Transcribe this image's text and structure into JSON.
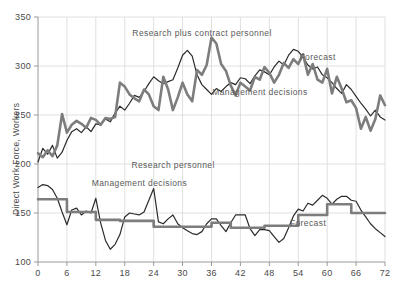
{
  "chart_data": {
    "type": "line",
    "title": "",
    "xlabel": "",
    "ylabel": "Direct Work Force, Workers",
    "xlim": [
      0,
      72
    ],
    "ylim": [
      100,
      350
    ],
    "xticks": [
      0,
      6,
      12,
      18,
      24,
      30,
      36,
      42,
      48,
      54,
      60,
      66,
      72
    ],
    "yticks": [
      100,
      150,
      200,
      250,
      300,
      350
    ],
    "grid": true,
    "legend_position": "inline-annotations",
    "annotations": [
      {
        "text": "Research plus contract personnel",
        "x": 34,
        "y": 333
      },
      {
        "text": "Forecast",
        "x": 58,
        "y": 308
      },
      {
        "text": "Management decisions",
        "x": 46,
        "y": 272
      },
      {
        "text": "Research personnel",
        "x": 28,
        "y": 198
      },
      {
        "text": "Management decisions",
        "x": 21,
        "y": 180
      },
      {
        "text": "Forecast",
        "x": 56,
        "y": 139
      }
    ],
    "colors": {
      "forecast_line": "#2b2b2b",
      "management_line": "#7d7d7d",
      "grid": "#d8d8d8",
      "axis": "#9a9a9a",
      "text": "#4a4a4a"
    },
    "series": [
      {
        "name": "Research plus contract personnel - Forecast",
        "group": "research-plus-contract",
        "role": "forecast",
        "color": "#2b2b2b",
        "width": 1.2,
        "x": [
          0,
          1,
          2,
          3,
          4,
          5,
          6,
          7,
          8,
          9,
          10,
          11,
          12,
          13,
          14,
          15,
          16,
          17,
          18,
          19,
          20,
          21,
          22,
          23,
          24,
          25,
          26,
          27,
          28,
          29,
          30,
          31,
          32,
          33,
          34,
          35,
          36,
          37,
          38,
          39,
          40,
          41,
          42,
          43,
          44,
          45,
          46,
          47,
          48,
          49,
          50,
          51,
          52,
          53,
          54,
          55,
          56,
          57,
          58,
          59,
          60,
          61,
          62,
          63,
          64,
          65,
          66,
          67,
          68,
          69,
          70,
          71,
          72
        ],
        "values": [
          202,
          216,
          210,
          219,
          206,
          212,
          224,
          233,
          236,
          232,
          238,
          233,
          241,
          240,
          246,
          243,
          252,
          259,
          255,
          262,
          270,
          268,
          274,
          282,
          289,
          285,
          282,
          284,
          286,
          298,
          311,
          316,
          310,
          291,
          281,
          276,
          271,
          277,
          274,
          279,
          283,
          281,
          288,
          287,
          282,
          290,
          296,
          294,
          291,
          299,
          305,
          301,
          311,
          317,
          315,
          309,
          301,
          297,
          299,
          291,
          288,
          283,
          277,
          272,
          281,
          276,
          269,
          262,
          256,
          249,
          255,
          248,
          245
        ]
      },
      {
        "name": "Research plus contract personnel - Management decisions",
        "group": "research-plus-contract",
        "role": "management",
        "color": "#7d7d7d",
        "width": 2.6,
        "x": [
          0,
          1,
          2,
          3,
          4,
          5,
          6,
          7,
          8,
          9,
          10,
          11,
          12,
          13,
          14,
          15,
          16,
          17,
          18,
          19,
          20,
          21,
          22,
          23,
          24,
          25,
          26,
          27,
          28,
          29,
          30,
          31,
          32,
          33,
          34,
          35,
          36,
          37,
          38,
          39,
          40,
          41,
          42,
          43,
          44,
          45,
          46,
          47,
          48,
          49,
          50,
          51,
          52,
          53,
          54,
          55,
          56,
          57,
          58,
          59,
          60,
          61,
          62,
          63,
          64,
          65,
          66,
          67,
          68,
          69,
          70,
          71,
          72
        ],
        "values": [
          211,
          207,
          214,
          208,
          219,
          251,
          232,
          240,
          244,
          241,
          237,
          247,
          245,
          240,
          247,
          246,
          248,
          283,
          279,
          271,
          267,
          264,
          276,
          271,
          259,
          255,
          289,
          276,
          255,
          268,
          283,
          271,
          264,
          296,
          291,
          301,
          329,
          323,
          302,
          295,
          280,
          270,
          283,
          279,
          275,
          289,
          286,
          299,
          293,
          283,
          291,
          303,
          298,
          307,
          302,
          312,
          291,
          302,
          286,
          283,
          297,
          272,
          289,
          277,
          263,
          265,
          257,
          236,
          248,
          234,
          246,
          270,
          260
        ]
      },
      {
        "name": "Research personnel - Forecast",
        "group": "research-personnel",
        "role": "forecast",
        "color": "#2b2b2b",
        "width": 1.2,
        "x": [
          0,
          1,
          2,
          3,
          4,
          5,
          6,
          7,
          8,
          9,
          10,
          11,
          12,
          13,
          14,
          15,
          16,
          17,
          18,
          19,
          20,
          21,
          22,
          23,
          24,
          25,
          26,
          27,
          28,
          29,
          30,
          31,
          32,
          33,
          34,
          35,
          36,
          37,
          38,
          39,
          40,
          41,
          42,
          43,
          44,
          45,
          46,
          47,
          48,
          49,
          50,
          51,
          52,
          53,
          54,
          55,
          56,
          57,
          58,
          59,
          60,
          61,
          62,
          63,
          64,
          65,
          66,
          67,
          68,
          69,
          70,
          71,
          72
        ],
        "values": [
          176,
          179,
          178,
          174,
          165,
          151,
          138,
          153,
          155,
          148,
          152,
          150,
          165,
          140,
          122,
          113,
          118,
          128,
          146,
          150,
          149,
          148,
          151,
          163,
          175,
          141,
          139,
          144,
          148,
          139,
          135,
          132,
          129,
          128,
          131,
          139,
          144,
          144,
          137,
          131,
          140,
          148,
          148,
          148,
          134,
          127,
          133,
          133,
          132,
          126,
          120,
          124,
          135,
          147,
          154,
          152,
          160,
          158,
          163,
          168,
          165,
          159,
          164,
          167,
          167,
          163,
          162,
          153,
          146,
          139,
          134,
          130,
          126
        ]
      },
      {
        "name": "Research personnel - Management decisions",
        "group": "research-personnel",
        "role": "management",
        "color": "#7d7d7d",
        "width": 2.6,
        "step": true,
        "x": [
          0,
          6,
          6,
          12,
          12,
          17,
          17,
          24,
          24,
          36,
          36,
          40,
          40,
          47,
          47,
          54,
          54,
          60,
          60,
          65,
          65,
          72
        ],
        "values": [
          164,
          164,
          151,
          151,
          143,
          143,
          142,
          142,
          136,
          136,
          140,
          140,
          135,
          135,
          137,
          137,
          148,
          148,
          159,
          159,
          150,
          150
        ]
      }
    ]
  }
}
